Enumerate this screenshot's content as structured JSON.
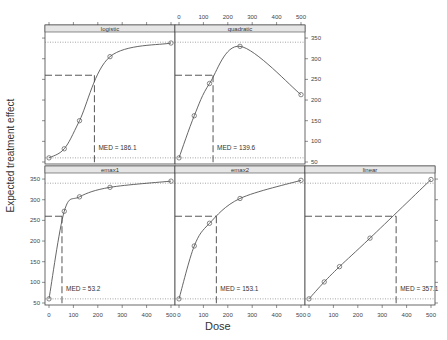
{
  "chart_data": {
    "type": "line",
    "title": "",
    "xlabel": "Dose",
    "ylabel": "Expected treatment effect",
    "xlim": [
      0,
      500
    ],
    "ylim": [
      50,
      355
    ],
    "x_ticks": [
      0,
      100,
      200,
      300,
      400,
      500
    ],
    "y_ticks": [
      50,
      100,
      150,
      200,
      250,
      300,
      350
    ],
    "reference_lines": {
      "lower": 60,
      "upper": 340,
      "delta_level": 260
    },
    "doses": [
      0,
      62.5,
      125,
      250,
      500
    ],
    "panels": [
      {
        "name": "logistic",
        "row": 0,
        "col": 0,
        "med": 186.1,
        "med_label": "MED = 186.1",
        "points": [
          [
            0,
            60
          ],
          [
            62.5,
            82
          ],
          [
            125,
            150
          ],
          [
            250,
            305
          ],
          [
            500,
            338
          ]
        ]
      },
      {
        "name": "quadratic",
        "row": 0,
        "col": 1,
        "med": 139.6,
        "med_label": "MED = 139.6",
        "points": [
          [
            0,
            60
          ],
          [
            62.5,
            162
          ],
          [
            125,
            240
          ],
          [
            250,
            330
          ],
          [
            500,
            213
          ]
        ]
      },
      {
        "name": "emax1",
        "row": 1,
        "col": 0,
        "med": 53.2,
        "med_label": "MED = 53.2",
        "points": [
          [
            0,
            60
          ],
          [
            62.5,
            272
          ],
          [
            125,
            307
          ],
          [
            250,
            330
          ],
          [
            500,
            345
          ]
        ]
      },
      {
        "name": "emax2",
        "row": 1,
        "col": 1,
        "med": 153.1,
        "med_label": "MED = 153.1",
        "points": [
          [
            0,
            60
          ],
          [
            62.5,
            188
          ],
          [
            125,
            243
          ],
          [
            250,
            303
          ],
          [
            500,
            347
          ]
        ]
      },
      {
        "name": "linear",
        "row": 1,
        "col": 2,
        "med": 357.1,
        "med_label": "MED = 357.1",
        "points": [
          [
            0,
            60
          ],
          [
            62.5,
            101
          ],
          [
            125,
            138
          ],
          [
            250,
            207
          ],
          [
            500,
            349
          ]
        ]
      }
    ]
  }
}
